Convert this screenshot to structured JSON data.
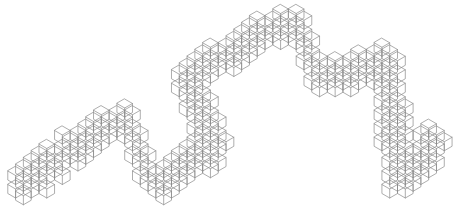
{
  "illustration": {
    "name": "isometric-cube-wave",
    "description": "Line-art band of stacked isometric wireframe cubes forming a wave/zigzag shape",
    "stroke_color": "#8a8a8a",
    "background_color": "#ffffff",
    "cell_size": 9,
    "segments": [
      {
        "name": "left-low-ramp",
        "from": [
          22,
          188
        ],
        "to": [
          70,
          150
        ],
        "thickness": 3
      },
      {
        "name": "left-peak",
        "from": [
          70,
          150
        ],
        "to": [
          125,
          118
        ],
        "thickness": 3
      },
      {
        "name": "left-drop",
        "from": [
          125,
          118
        ],
        "to": [
          150,
          185
        ],
        "thickness": 2
      },
      {
        "name": "valley",
        "from": [
          150,
          185
        ],
        "to": [
          215,
          150
        ],
        "thickness": 3
      },
      {
        "name": "mid-rise",
        "from": [
          215,
          150
        ],
        "to": [
          190,
          75
        ],
        "thickness": 3
      },
      {
        "name": "mid-upper",
        "from": [
          190,
          75
        ],
        "to": [
          295,
          18
        ],
        "thickness": 3
      },
      {
        "name": "top-drop",
        "from": [
          295,
          18
        ],
        "to": [
          320,
          80
        ],
        "thickness": 2
      },
      {
        "name": "shoulder",
        "from": [
          320,
          80
        ],
        "to": [
          385,
          60
        ],
        "thickness": 3
      },
      {
        "name": "right-descent",
        "from": [
          385,
          60
        ],
        "to": [
          400,
          185
        ],
        "thickness": 3
      },
      {
        "name": "right-tail",
        "from": [
          400,
          185
        ],
        "to": [
          440,
          135
        ],
        "thickness": 3
      }
    ]
  }
}
